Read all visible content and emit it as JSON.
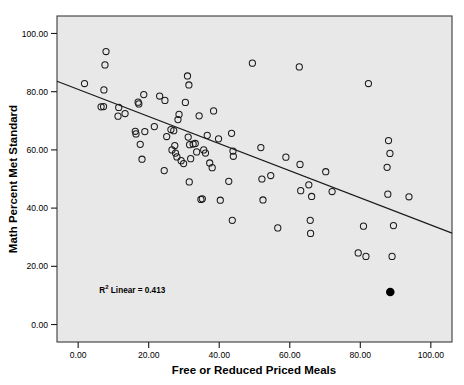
{
  "chart_data": {
    "type": "scatter",
    "title": "",
    "xlabel": "Free or Reduced Priced Meals",
    "ylabel": "Math Percent Met Standard",
    "xlim": [
      -6,
      106
    ],
    "ylim": [
      -6,
      106
    ],
    "xticks": [
      0,
      20,
      40,
      60,
      80,
      100
    ],
    "yticks": [
      0,
      20,
      40,
      60,
      80,
      100
    ],
    "xtick_labels": [
      "0.00",
      "20.00",
      "40.00",
      "60.00",
      "80.00",
      "100.00"
    ],
    "ytick_labels": [
      "0.00",
      "20.00",
      "40.00",
      "60.00",
      "80.00",
      "100.00"
    ],
    "grid": false,
    "legend": "none",
    "plot_background": "#e8e8e8",
    "marker_color": "#1a1a1a",
    "marker_fill": "none",
    "marker_style": "open-circle",
    "annotation": {
      "text_prefix": "R",
      "text_superscript": "2",
      "text_suffix": " Linear = 0.413",
      "r_squared": 0.413,
      "x": 6,
      "y": 11
    },
    "fit_line": {
      "type": "linear",
      "slope": -0.466,
      "intercept": 80.8,
      "color": "#1a1a1a",
      "x_start": -6,
      "x_end": 106,
      "y_start": 83.6,
      "y_end": 31.4
    },
    "highlighted_point": {
      "x": 88.5,
      "y": 11.2,
      "style": "filled-circle",
      "color": "#000000"
    },
    "points": [
      {
        "x": 1.8,
        "y": 82.8
      },
      {
        "x": 7.9,
        "y": 93.8
      },
      {
        "x": 7.6,
        "y": 89.2
      },
      {
        "x": 7.3,
        "y": 80.6
      },
      {
        "x": 6.5,
        "y": 74.8
      },
      {
        "x": 7.2,
        "y": 74.9
      },
      {
        "x": 11.5,
        "y": 74.6
      },
      {
        "x": 11.3,
        "y": 71.6
      },
      {
        "x": 13.3,
        "y": 72.5
      },
      {
        "x": 16.2,
        "y": 66.4
      },
      {
        "x": 16.4,
        "y": 65.5
      },
      {
        "x": 17.0,
        "y": 76.4
      },
      {
        "x": 17.2,
        "y": 75.8
      },
      {
        "x": 18.6,
        "y": 79.0
      },
      {
        "x": 18.9,
        "y": 66.3
      },
      {
        "x": 17.6,
        "y": 61.9
      },
      {
        "x": 18.1,
        "y": 56.8
      },
      {
        "x": 21.6,
        "y": 68.0
      },
      {
        "x": 23.1,
        "y": 78.5
      },
      {
        "x": 24.6,
        "y": 77.0
      },
      {
        "x": 24.4,
        "y": 52.9
      },
      {
        "x": 25.1,
        "y": 64.6
      },
      {
        "x": 26.3,
        "y": 67.0
      },
      {
        "x": 26.6,
        "y": 60.0
      },
      {
        "x": 27.1,
        "y": 66.6
      },
      {
        "x": 27.4,
        "y": 61.5
      },
      {
        "x": 27.6,
        "y": 58.9
      },
      {
        "x": 28.0,
        "y": 57.6
      },
      {
        "x": 28.3,
        "y": 70.4
      },
      {
        "x": 28.6,
        "y": 72.2
      },
      {
        "x": 29.2,
        "y": 56.3
      },
      {
        "x": 29.9,
        "y": 55.3
      },
      {
        "x": 30.4,
        "y": 76.3
      },
      {
        "x": 31.0,
        "y": 85.4
      },
      {
        "x": 31.4,
        "y": 82.3
      },
      {
        "x": 31.2,
        "y": 64.4
      },
      {
        "x": 31.6,
        "y": 61.8
      },
      {
        "x": 31.9,
        "y": 57.0
      },
      {
        "x": 31.5,
        "y": 49.0
      },
      {
        "x": 32.6,
        "y": 62.0
      },
      {
        "x": 33.2,
        "y": 62.2
      },
      {
        "x": 33.6,
        "y": 59.3
      },
      {
        "x": 34.3,
        "y": 71.7
      },
      {
        "x": 34.8,
        "y": 43.0
      },
      {
        "x": 35.2,
        "y": 43.2
      },
      {
        "x": 35.6,
        "y": 60.0
      },
      {
        "x": 36.1,
        "y": 58.9
      },
      {
        "x": 36.6,
        "y": 65.0
      },
      {
        "x": 37.3,
        "y": 55.5
      },
      {
        "x": 38.0,
        "y": 53.9
      },
      {
        "x": 38.4,
        "y": 73.4
      },
      {
        "x": 39.8,
        "y": 63.8
      },
      {
        "x": 40.3,
        "y": 42.7
      },
      {
        "x": 42.7,
        "y": 49.2
      },
      {
        "x": 43.5,
        "y": 65.7
      },
      {
        "x": 43.9,
        "y": 59.6
      },
      {
        "x": 44.0,
        "y": 57.8
      },
      {
        "x": 43.7,
        "y": 35.8
      },
      {
        "x": 49.4,
        "y": 89.8
      },
      {
        "x": 51.8,
        "y": 60.8
      },
      {
        "x": 52.1,
        "y": 50.0
      },
      {
        "x": 52.4,
        "y": 42.8
      },
      {
        "x": 54.6,
        "y": 51.2
      },
      {
        "x": 56.6,
        "y": 33.2
      },
      {
        "x": 58.9,
        "y": 57.5
      },
      {
        "x": 62.7,
        "y": 88.5
      },
      {
        "x": 62.9,
        "y": 55.0
      },
      {
        "x": 63.1,
        "y": 46.0
      },
      {
        "x": 65.4,
        "y": 48.0
      },
      {
        "x": 65.8,
        "y": 35.8
      },
      {
        "x": 65.9,
        "y": 31.3
      },
      {
        "x": 66.2,
        "y": 44.0
      },
      {
        "x": 70.2,
        "y": 52.5
      },
      {
        "x": 72.0,
        "y": 45.7
      },
      {
        "x": 79.4,
        "y": 24.6
      },
      {
        "x": 81.6,
        "y": 23.4
      },
      {
        "x": 80.9,
        "y": 33.8
      },
      {
        "x": 82.3,
        "y": 82.8
      },
      {
        "x": 88.0,
        "y": 63.2
      },
      {
        "x": 88.4,
        "y": 58.8
      },
      {
        "x": 87.6,
        "y": 54.0
      },
      {
        "x": 87.8,
        "y": 44.8
      },
      {
        "x": 89.4,
        "y": 34.0
      },
      {
        "x": 89.0,
        "y": 23.4
      },
      {
        "x": 93.8,
        "y": 43.9
      }
    ]
  }
}
